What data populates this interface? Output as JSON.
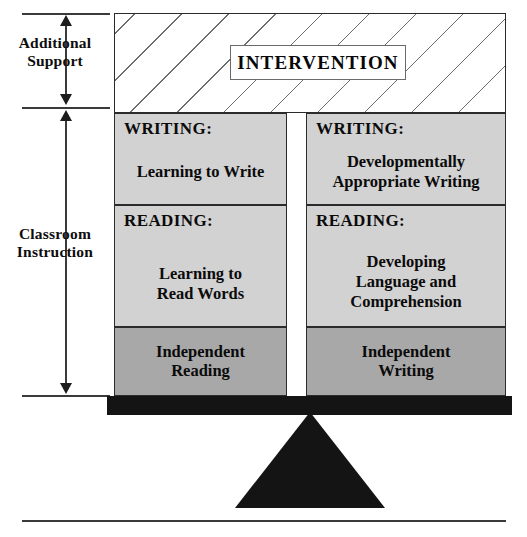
{
  "diagram": {
    "colors": {
      "light_block": "#d2d2d2",
      "dark_block": "#a8a8a8",
      "beam": "#141414",
      "outline": "#2b2b2b"
    }
  },
  "axis": {
    "segments": [
      {
        "label": "Additional\nSupport",
        "line1": "Additional",
        "line2": "Support"
      },
      {
        "label": "Classroom\nInstruction",
        "line1": "Classroom",
        "line2": "Instruction"
      }
    ]
  },
  "intervention": {
    "label": "INTERVENTION",
    "fill": "diagonal-hatch"
  },
  "columns": [
    {
      "side": "left",
      "name": "reading-column",
      "blocks": [
        {
          "name": "writing-learning-to-write",
          "header": "WRITING:",
          "line1": "Learning to Write",
          "line2": "",
          "line3": "",
          "shade": "light"
        },
        {
          "name": "reading-learning-to-read-words",
          "header": "READING:",
          "line1": "Learning to",
          "line2": "Read Words",
          "line3": "",
          "shade": "light"
        },
        {
          "name": "independent-reading",
          "header": "",
          "line1": "Independent",
          "line2": "Reading",
          "line3": "",
          "shade": "dark"
        }
      ]
    },
    {
      "side": "right",
      "name": "writing-column",
      "blocks": [
        {
          "name": "writing-developmentally-appropriate",
          "header": "WRITING:",
          "line1": "Developmentally",
          "line2": "Appropriate Writing",
          "line3": "",
          "shade": "light"
        },
        {
          "name": "reading-developing-language",
          "header": "READING:",
          "line1": "Developing",
          "line2": "Language and",
          "line3": "Comprehension",
          "shade": "light"
        },
        {
          "name": "independent-writing",
          "header": "",
          "line1": "Independent",
          "line2": "Writing",
          "line3": "",
          "shade": "dark"
        }
      ]
    }
  ]
}
